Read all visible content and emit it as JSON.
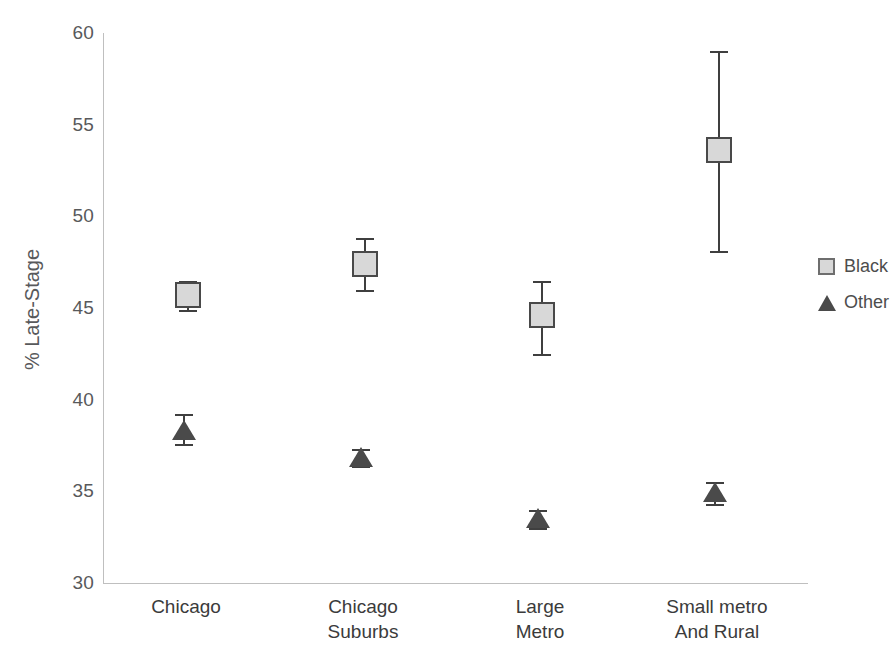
{
  "chart_data": {
    "type": "scatter",
    "title": "",
    "xlabel": "",
    "ylabel": "% Late-Stage",
    "ylim": [
      30,
      60
    ],
    "ytick_labels": [
      "60",
      "55",
      "50",
      "45",
      "40",
      "35",
      "30"
    ],
    "ytick_values": [
      60,
      55,
      50,
      45,
      40,
      35,
      30
    ],
    "grid": false,
    "legend_position": "right",
    "categories": [
      "Chicago",
      "Chicago Suburbs",
      "Large Metro",
      "Small metro And Rural"
    ],
    "category_lines": [
      [
        "Chicago"
      ],
      [
        "Chicago",
        "Suburbs"
      ],
      [
        "Large",
        "Metro"
      ],
      [
        "Small metro",
        "And Rural"
      ]
    ],
    "series": [
      {
        "name": "Black",
        "marker": "square",
        "color": "#d8d8d8",
        "edge_color": "#494949",
        "values": [
          45.7,
          47.4,
          44.6,
          53.6
        ],
        "err_low": [
          44.9,
          46.0,
          42.5,
          48.1
        ],
        "err_high": [
          46.5,
          48.8,
          46.5,
          59.0
        ]
      },
      {
        "name": "Other",
        "marker": "triangle",
        "color": "#4a4a4a",
        "edge_color": "#4a4a4a",
        "values": [
          38.3,
          36.8,
          33.5,
          34.9
        ],
        "err_low": [
          37.6,
          36.4,
          33.0,
          34.3
        ],
        "err_high": [
          39.2,
          37.3,
          34.0,
          35.5
        ]
      }
    ]
  },
  "legend": {
    "items": [
      {
        "label": "Black",
        "key": "square-marker-icon"
      },
      {
        "label": "Other",
        "key": "triangle-marker-icon"
      }
    ]
  }
}
